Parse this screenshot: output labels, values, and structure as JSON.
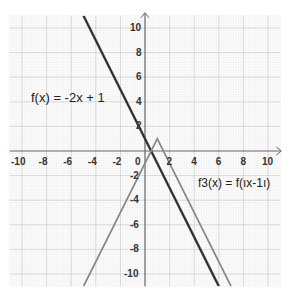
{
  "chart_data": {
    "type": "line",
    "title": "",
    "xlabel": "",
    "ylabel": "",
    "xlim": [
      -11,
      11
    ],
    "ylim": [
      -11,
      11
    ],
    "grid": true,
    "x_ticks": [
      -10,
      -8,
      -6,
      -4,
      -2,
      0,
      2,
      4,
      6,
      8,
      10
    ],
    "y_ticks": [
      10,
      8,
      6,
      4,
      2,
      -2,
      -4,
      -6,
      -8,
      -10
    ],
    "series": [
      {
        "name": "f(x) = -2x + 1",
        "color": "#333333",
        "formula": "-2x+1",
        "points": [
          [
            -5,
            11
          ],
          [
            0,
            1
          ],
          [
            6,
            -11
          ]
        ]
      },
      {
        "name": "f3(x) = f(ıx-1ı)",
        "color": "#888888",
        "formula": "-2|x-1|+1",
        "points": [
          [
            -5,
            -11
          ],
          [
            1,
            1
          ],
          [
            7,
            -11
          ]
        ]
      }
    ],
    "annotations": [
      {
        "text": "f(x) = -2x + 1",
        "x": -9.5,
        "y": 4.5
      },
      {
        "text": "f3(x) = f(ıx-1ı)",
        "x": 3.0,
        "y": -3.0
      }
    ]
  },
  "labels": {
    "f_label": "f(x) = -2x + 1",
    "f3_label": "f3(x) = f(ıx-1ı)"
  }
}
